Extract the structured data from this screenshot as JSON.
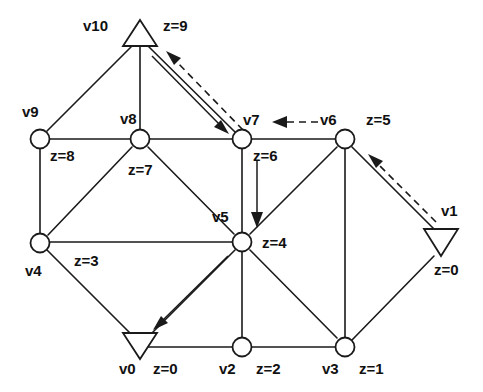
{
  "diagram": {
    "colors": {
      "stroke": "#1a1a1a",
      "background": "#ffffff",
      "node_fill": "#ffffff"
    },
    "nodes": [
      {
        "id": "v0",
        "label": "v0",
        "z_label": "z=0",
        "shape": "triangle-down",
        "x": 140,
        "y": 335
      },
      {
        "id": "v1",
        "label": "v1",
        "z_label": "z=0",
        "shape": "triangle-down",
        "x": 440,
        "y": 240
      },
      {
        "id": "v2",
        "label": "v2",
        "z_label": "z=2",
        "shape": "circle",
        "x": 242,
        "y": 347
      },
      {
        "id": "v3",
        "label": "v3",
        "z_label": "z=1",
        "shape": "circle",
        "x": 345,
        "y": 347
      },
      {
        "id": "v4",
        "label": "v4",
        "z_label": "z=3",
        "shape": "circle",
        "x": 40,
        "y": 243
      },
      {
        "id": "v5",
        "label": "v5",
        "z_label": "z=4",
        "shape": "circle",
        "x": 242,
        "y": 242
      },
      {
        "id": "v6",
        "label": "v6",
        "z_label": "z=5",
        "shape": "circle",
        "x": 345,
        "y": 139
      },
      {
        "id": "v7",
        "label": "v7",
        "z_label": "z=6",
        "shape": "circle",
        "x": 242,
        "y": 139
      },
      {
        "id": "v8",
        "label": "v8",
        "z_label": "z=7",
        "shape": "circle",
        "x": 140,
        "y": 139
      },
      {
        "id": "v9",
        "label": "v9",
        "z_label": "z=8",
        "shape": "circle",
        "x": 40,
        "y": 139
      },
      {
        "id": "v10",
        "label": "v10",
        "z_label": "z=9",
        "shape": "triangle-up",
        "x": 140,
        "y": 36
      }
    ],
    "edges": [
      {
        "from": "v10",
        "to": "v9"
      },
      {
        "from": "v10",
        "to": "v8"
      },
      {
        "from": "v10",
        "to": "v7"
      },
      {
        "from": "v9",
        "to": "v8"
      },
      {
        "from": "v9",
        "to": "v4"
      },
      {
        "from": "v8",
        "to": "v7"
      },
      {
        "from": "v8",
        "to": "v4"
      },
      {
        "from": "v8",
        "to": "v5"
      },
      {
        "from": "v7",
        "to": "v6"
      },
      {
        "from": "v7",
        "to": "v5"
      },
      {
        "from": "v6",
        "to": "v5"
      },
      {
        "from": "v6",
        "to": "v3"
      },
      {
        "from": "v6",
        "to": "v1"
      },
      {
        "from": "v4",
        "to": "v5"
      },
      {
        "from": "v4",
        "to": "v0"
      },
      {
        "from": "v5",
        "to": "v0"
      },
      {
        "from": "v5",
        "to": "v2"
      },
      {
        "from": "v5",
        "to": "v3"
      },
      {
        "from": "v0",
        "to": "v2"
      },
      {
        "from": "v2",
        "to": "v3"
      },
      {
        "from": "v3",
        "to": "v1"
      }
    ],
    "arrows": [
      {
        "name": "solid-arrow-v10-to-v7",
        "style": "solid",
        "from": "v10",
        "to": "v7"
      },
      {
        "name": "dashed-arrow-v7-to-v10",
        "style": "dashed",
        "from": "v7",
        "to": "v10"
      },
      {
        "name": "dashed-arrow-v6-to-v7",
        "style": "dashed",
        "from": "v6",
        "to": "v7"
      },
      {
        "name": "dashed-arrow-v1-to-v6",
        "style": "dashed",
        "from": "v1",
        "to": "v6"
      },
      {
        "name": "solid-arrow-v7-to-v5",
        "style": "solid",
        "from": "v7",
        "to": "v5"
      },
      {
        "name": "solid-arrow-v5-to-v0",
        "style": "solid",
        "from": "v5",
        "to": "v0"
      }
    ],
    "labels": [
      {
        "name": "node-label-v10",
        "text": "v10",
        "x": 83,
        "y": 18
      },
      {
        "name": "z-label-v10",
        "text": "z=9",
        "x": 163,
        "y": 18
      },
      {
        "name": "node-label-v9",
        "text": "v9",
        "x": 22,
        "y": 104
      },
      {
        "name": "node-label-v8",
        "text": "v8",
        "x": 120,
        "y": 111
      },
      {
        "name": "node-label-v7",
        "text": "v7",
        "x": 243,
        "y": 112
      },
      {
        "name": "node-label-v6",
        "text": "v6",
        "x": 320,
        "y": 112
      },
      {
        "name": "z-label-v6",
        "text": "z=5",
        "x": 366,
        "y": 112
      },
      {
        "name": "z-label-v9",
        "text": "z=8",
        "x": 50,
        "y": 148
      },
      {
        "name": "z-label-v7",
        "text": "z=6",
        "x": 253,
        "y": 148
      },
      {
        "name": "z-label-v8",
        "text": "z=7",
        "x": 128,
        "y": 162
      },
      {
        "name": "node-label-v5",
        "text": "v5",
        "x": 212,
        "y": 209
      },
      {
        "name": "node-label-v1",
        "text": "v1",
        "x": 441,
        "y": 203
      },
      {
        "name": "z-label-v5",
        "text": "z=4",
        "x": 262,
        "y": 235
      },
      {
        "name": "z-label-v4",
        "text": "z=3",
        "x": 74,
        "y": 253
      },
      {
        "name": "node-label-v4",
        "text": "v4",
        "x": 25,
        "y": 263
      },
      {
        "name": "z-label-v1",
        "text": "z=0",
        "x": 434,
        "y": 262
      },
      {
        "name": "node-label-v0",
        "text": "v0",
        "x": 119,
        "y": 361
      },
      {
        "name": "z-label-v0",
        "text": "z=0",
        "x": 153,
        "y": 361
      },
      {
        "name": "node-label-v2",
        "text": "v2",
        "x": 219,
        "y": 361
      },
      {
        "name": "z-label-v2",
        "text": "z=2",
        "x": 256,
        "y": 361
      },
      {
        "name": "node-label-v3",
        "text": "v3",
        "x": 322,
        "y": 361
      },
      {
        "name": "z-label-v3",
        "text": "z=1",
        "x": 359,
        "y": 361
      }
    ]
  }
}
